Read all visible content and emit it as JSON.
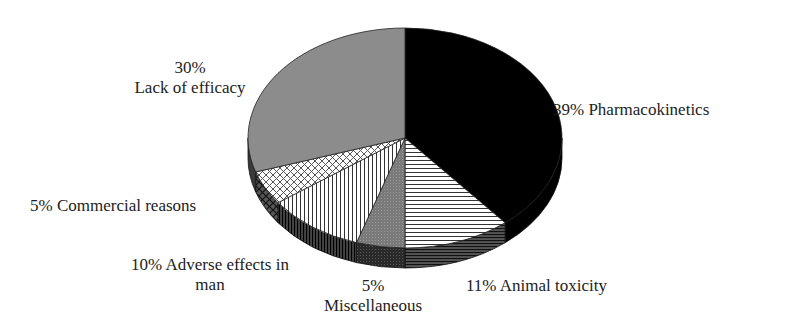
{
  "chart_data": {
    "type": "pie",
    "style": "3d-exploded-none",
    "title": "",
    "start_angle_deg": 0,
    "direction": "clockwise",
    "slices": [
      {
        "label": "Pharmacokinetics",
        "value": 39,
        "display": "39% Pharmacokinetics",
        "fill": "#000000",
        "pattern": "solid"
      },
      {
        "label": "Animal toxicity",
        "value": 11,
        "display": "11% Animal toxicity",
        "fill": "#ffffff",
        "pattern": "horizontal-lines"
      },
      {
        "label": "Miscellaneous",
        "value": 5,
        "display": "5% Miscellaneous",
        "fill": "#7a7a7a",
        "pattern": "dotted-gray"
      },
      {
        "label": "Adverse effects in man",
        "value": 10,
        "display": "10% Adverse effects in man",
        "fill": "#ffffff",
        "pattern": "vertical-lines"
      },
      {
        "label": "Commercial reasons",
        "value": 5,
        "display": "5% Commercial reasons",
        "fill": "#ffffff",
        "pattern": "crosshatch"
      },
      {
        "label": "Lack of efficacy",
        "value": 30,
        "display": "30% Lack of efficacy",
        "fill": "#8c8c8c",
        "pattern": "solid"
      }
    ],
    "legend": "none (direct labels)"
  },
  "labels": {
    "pharmacokinetics": "39% Pharmacokinetics",
    "animal_toxicity": "11% Animal toxicity",
    "misc_pct": "5%",
    "misc_name": "Miscellaneous",
    "adverse_line1": "10% Adverse effects in",
    "adverse_line2": "man",
    "commercial": "5% Commercial reasons",
    "efficacy_pct": "30%",
    "efficacy_name": "Lack of efficacy"
  }
}
